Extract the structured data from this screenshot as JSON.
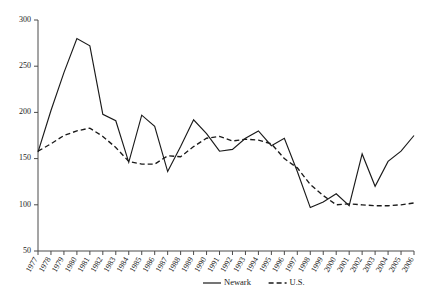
{
  "chart_data": {
    "type": "line",
    "title": "",
    "subtitle": "",
    "xlabel": "",
    "ylabel": "",
    "xlim": [
      1977,
      2006
    ],
    "ylim": [
      50,
      300
    ],
    "grid": false,
    "legend_position": "bottom-right",
    "x": [
      1977,
      1978,
      1979,
      1980,
      1981,
      1982,
      1983,
      1984,
      1985,
      1986,
      1987,
      1988,
      1989,
      1990,
      1991,
      1992,
      1993,
      1994,
      1995,
      1996,
      1997,
      1998,
      1999,
      2000,
      2001,
      2002,
      2003,
      2004,
      2005,
      2006
    ],
    "categories": [
      "1977",
      "1978",
      "1979",
      "1980",
      "1981",
      "1982",
      "1983",
      "1984",
      "1985",
      "1986",
      "1987",
      "1988",
      "1989",
      "1990",
      "1991",
      "1992",
      "1993",
      "1994",
      "1995",
      "1996",
      "1997",
      "1998",
      "1999",
      "2000",
      "2001",
      "2002",
      "2003",
      "2004",
      "2005",
      "2006"
    ],
    "ytick_labels": [
      "50",
      "100",
      "150",
      "200",
      "250",
      "300"
    ],
    "ytick_values": [
      50,
      100,
      150,
      200,
      250,
      300
    ],
    "series": [
      {
        "name": "Newark",
        "style": "solid",
        "color": "#1a1a1a",
        "values": [
          157,
          202,
          243,
          280,
          272,
          198,
          191,
          146,
          197,
          185,
          136,
          163,
          192,
          177,
          158,
          160,
          172,
          180,
          164,
          172,
          136,
          97,
          103,
          112,
          99,
          155,
          120,
          147,
          158,
          175
        ]
      },
      {
        "name": "U.S.",
        "style": "dashed",
        "color": "#1a1a1a",
        "values": [
          158,
          166,
          175,
          180,
          183,
          174,
          162,
          147,
          144,
          144,
          153,
          152,
          163,
          172,
          174,
          169,
          171,
          170,
          166,
          150,
          140,
          122,
          110,
          100,
          101,
          100,
          99,
          99,
          100,
          102
        ]
      }
    ],
    "legend": [
      {
        "label": "Newark",
        "style": "solid"
      },
      {
        "label": "U.S.",
        "style": "dashed"
      }
    ]
  }
}
